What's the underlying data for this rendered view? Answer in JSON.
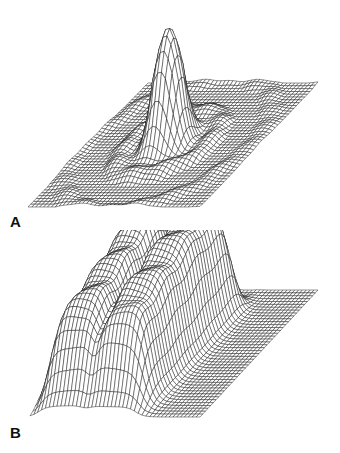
{
  "figure": {
    "panels": [
      {
        "id": "A",
        "label": "A",
        "description": "3D wireframe surface: single tall central peak surrounded by concentric ripples (sinc-like)",
        "base": {
          "top_left": [
            148,
            83
          ],
          "top_right": [
            318,
            83
          ],
          "bottom_left": [
            28,
            207
          ],
          "bottom_right": [
            200,
            207
          ]
        },
        "surface": {
          "type": "sinc_peak",
          "center": [
            0.47,
            0.5
          ],
          "height": 120,
          "width": 0.07,
          "ripple": 14,
          "ripple_freq": 26
        },
        "grid": {
          "rows": 44,
          "cols": 44
        }
      },
      {
        "id": "B",
        "label": "B",
        "description": "3D wireframe surface: broad raised plateau with ridged crests and a central valley, flat base elsewhere",
        "base": {
          "top_left": [
            148,
            60
          ],
          "top_right": [
            318,
            60
          ],
          "bottom_left": [
            30,
            187
          ],
          "bottom_right": [
            200,
            187
          ]
        },
        "surface": {
          "type": "plateau",
          "x_range": [
            0.05,
            0.62
          ],
          "y_range": [
            0.15,
            0.95
          ],
          "height": 120,
          "valley_x": 0.33,
          "valley_depth": 40
        },
        "grid": {
          "rows": 44,
          "cols": 44
        }
      }
    ],
    "colors": {
      "line": "#111111",
      "fill": "#ffffff",
      "background": "#ffffff"
    }
  }
}
